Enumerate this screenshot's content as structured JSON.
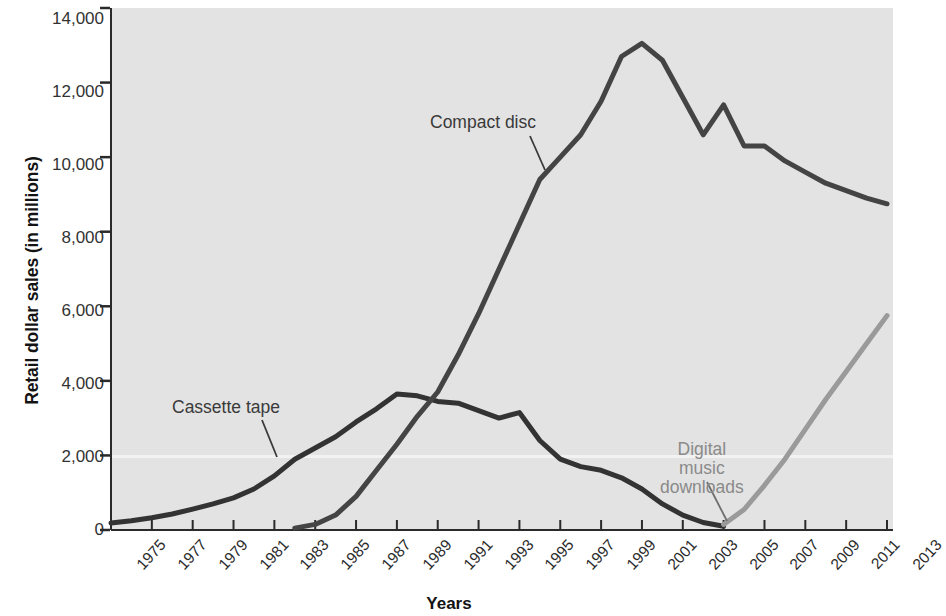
{
  "chart_data": {
    "type": "line",
    "title": "",
    "xlabel": "Years",
    "ylabel": "Retail dollar sales (in millions)",
    "xlim": [
      1975,
      2013
    ],
    "ylim": [
      0,
      14000
    ],
    "grid": false,
    "legend_position": "inline-annotations",
    "x_ticks": [
      "1975",
      "1977",
      "1979",
      "1981",
      "1983",
      "1985",
      "1987",
      "1989",
      "1991",
      "1993",
      "1995",
      "1997",
      "1999",
      "2001",
      "2003",
      "2005",
      "2007",
      "2009",
      "2011",
      "2013"
    ],
    "y_ticks": [
      "0",
      "2,000",
      "4,000",
      "6,000",
      "8,000",
      "10,000",
      "12,000",
      "14,000"
    ],
    "y_tick_values": [
      0,
      2000,
      4000,
      6000,
      8000,
      10000,
      12000,
      14000
    ],
    "series": [
      {
        "name": "Cassette tape",
        "color": "#333333",
        "x": [
          1975,
          1976,
          1977,
          1978,
          1979,
          1980,
          1981,
          1982,
          1983,
          1984,
          1985,
          1986,
          1987,
          1988,
          1989,
          1990,
          1991,
          1992,
          1993,
          1994,
          1995,
          1996,
          1997,
          1998,
          1999,
          2000,
          2001,
          2002,
          2003,
          2004,
          2005
        ],
        "values": [
          190,
          250,
          330,
          430,
          560,
          700,
          860,
          1100,
          1450,
          1900,
          2200,
          2500,
          2900,
          3250,
          3650,
          3600,
          3450,
          3400,
          3200,
          3000,
          3150,
          2400,
          1900,
          1700,
          1600,
          1400,
          1100,
          700,
          400,
          200,
          100
        ]
      },
      {
        "name": "Compact disc",
        "color": "#444444",
        "x": [
          1984,
          1985,
          1986,
          1987,
          1988,
          1989,
          1990,
          1991,
          1992,
          1993,
          1994,
          1995,
          1996,
          1997,
          1998,
          1999,
          2000,
          2001,
          2002,
          2003,
          2004,
          2005,
          2006,
          2007,
          2008,
          2009,
          2010,
          2011,
          2012,
          2013
        ],
        "values": [
          50,
          150,
          400,
          900,
          1600,
          2300,
          3050,
          3700,
          4700,
          5800,
          7000,
          8200,
          9400,
          10000,
          10600,
          11500,
          12700,
          13050,
          12600,
          11600,
          10600,
          11400,
          10300,
          10300,
          9900,
          9600,
          9300,
          9100,
          8900,
          8750
        ]
      },
      {
        "name": "Digital music downloads",
        "color": "#9a9a9a",
        "x": [
          2005,
          2006,
          2007,
          2008,
          2009,
          2010,
          2011,
          2012,
          2013
        ],
        "values": [
          150,
          550,
          1200,
          1900,
          2700,
          3500,
          4250,
          5000,
          5750
        ]
      }
    ],
    "annotations": [
      {
        "id": "compact-disc",
        "text": "Compact disc",
        "color": "#3a3a3a"
      },
      {
        "id": "cassette-tape",
        "text": "Cassette tape",
        "color": "#3a3a3a"
      },
      {
        "id": "digital-downloads",
        "line1": "Digital",
        "line2": "music",
        "line3": "downloads",
        "color": "#8a8a8a"
      }
    ]
  }
}
